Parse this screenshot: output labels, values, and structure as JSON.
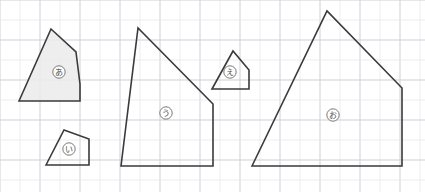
{
  "figure": {
    "canvas": {
      "width": 425,
      "height": 192
    },
    "background_color": "#ffffff",
    "grid": {
      "minor_spacing": 20,
      "minor_color": "#e9e9ed",
      "major_color": "#c9c9d2",
      "visible": true
    },
    "stroke_color": "#3a3a3a",
    "fill_color": "#ebebeb"
  },
  "shapes": [
    {
      "id": "shape-a",
      "label": "あ",
      "sides": 5,
      "filled": true,
      "label_x": 59,
      "label_y": 72,
      "points": "19,101 51,29 76,52 80,84 80,101",
      "path": "M19,101 L51,29 L76,52 L80,84 L80,101 Z"
    },
    {
      "id": "shape-i",
      "label": "い",
      "sides": 4,
      "filled": false,
      "label_x": 69,
      "label_y": 149,
      "points": "46,165 64,130 89,139 89,165",
      "path": "M46,165 L64,130 L89,139 L89,165 Z"
    },
    {
      "id": "shape-u",
      "label": "う",
      "sides": 4,
      "filled": false,
      "label_x": 166,
      "label_y": 113,
      "points": "121,166 138,28 213,104 213,166",
      "path": "M121,166 L138,28 L213,104 L213,166 Z"
    },
    {
      "id": "shape-e",
      "label": "え",
      "sides": 4,
      "filled": false,
      "label_x": 230,
      "label_y": 72,
      "points": "212,89 233,51 249,70 249,89",
      "path": "M212,89 L233,51 L249,70 L249,89 Z"
    },
    {
      "id": "shape-o",
      "label": "お",
      "sides": 5,
      "filled": false,
      "label_x": 333,
      "label_y": 115,
      "points": "252,166 327,11 402,88 402,166 252,166",
      "path": "M252,166 L327,11 L402,88 L402,166 Z"
    }
  ]
}
